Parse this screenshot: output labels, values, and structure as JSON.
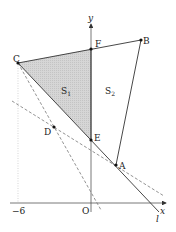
{
  "diagram": {
    "type": "coordinate-geometry",
    "axes": {
      "x_label": "x",
      "y_label": "y",
      "origin_label": "O",
      "tick_labels": [
        {
          "value": -6,
          "text": "−6"
        }
      ]
    },
    "points": {
      "A": {
        "label": "A"
      },
      "B": {
        "label": "B"
      },
      "C": {
        "label": "C"
      },
      "D": {
        "label": "D"
      },
      "E": {
        "label": "E"
      },
      "F": {
        "label": "F"
      }
    },
    "regions": {
      "S1": {
        "label": "S",
        "sub": "1",
        "fill": "#d9d9d9"
      },
      "S2": {
        "label": "S",
        "sub": "2"
      }
    },
    "line_label": "l"
  }
}
